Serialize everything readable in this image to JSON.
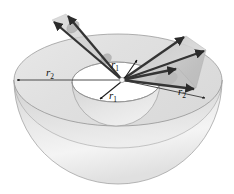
{
  "figure": {
    "labels": [
      {
        "id": "r2-left",
        "base": "r",
        "sub": "2",
        "x": 50,
        "y": 76,
        "name": "radius-label-r2-left"
      },
      {
        "id": "r1-upper",
        "base": "r",
        "sub": "1",
        "x": 115,
        "y": 68,
        "name": "radius-label-r1-upper"
      },
      {
        "id": "r1-lower",
        "base": "r",
        "sub": "1",
        "x": 113,
        "y": 99,
        "name": "radius-label-r1-lower"
      },
      {
        "id": "r2-right",
        "base": "r",
        "sub": "2",
        "x": 182,
        "y": 95,
        "name": "radius-label-r2-right"
      }
    ],
    "colors": {
      "outline": "#8a8a8a",
      "arrow": "#3a3a3a",
      "arrow_dark": "#262626",
      "top_annulus": "#e3e3e3",
      "inner_disk": "#efefef",
      "inner_bowl": "#dcdcdc",
      "outer_bowl_light": "#f2f2f2",
      "outer_bowl_mid": "#d9d9d9",
      "cone_fill": "#c9c9c9",
      "cone_fill_light": "#dedede",
      "background": "#ffffff",
      "label_text": "#111111"
    },
    "geometry": {
      "center": {
        "x": 122,
        "y": 80
      },
      "outer_ellipse": {
        "cx": 118,
        "cy": 80,
        "rx": 104,
        "ry": 46
      },
      "inner_ellipse": {
        "cx": 116,
        "cy": 82,
        "rx": 44,
        "ry": 20
      },
      "outer_bowl_depth": 104,
      "inner_bowl_depth": 42,
      "r2_left_endpoint": {
        "x": 15,
        "y": 80
      },
      "r2_right_endpoint": {
        "x": 207,
        "y": 99
      }
    },
    "ray_bundles": [
      {
        "name": "upper-left-bundle",
        "direction": "up-left",
        "rays": [
          {
            "x2": 52,
            "y2": 20
          },
          {
            "x2": 66,
            "y2": 14
          }
        ],
        "cone_shading": true
      },
      {
        "name": "right-bundle",
        "direction": "up-right and right",
        "rays": [
          {
            "x2": 186,
            "y2": 36
          },
          {
            "x2": 206,
            "y2": 50
          },
          {
            "x2": 178,
            "y2": 68
          },
          {
            "x2": 196,
            "y2": 88
          }
        ],
        "cone_shading": true
      }
    ],
    "radius_arrows": [
      {
        "name": "r1-arrow-upper",
        "from": {
          "x": 122,
          "y": 80
        },
        "to": {
          "x": 137,
          "y": 60
        }
      },
      {
        "name": "r1-arrow-lower",
        "from": {
          "x": 122,
          "y": 80
        },
        "to": {
          "x": 100,
          "y": 98
        }
      },
      {
        "name": "r2-arrow-left",
        "from": {
          "x": 122,
          "y": 80
        },
        "to": {
          "x": 15,
          "y": 80
        }
      },
      {
        "name": "r2-arrow-right",
        "from": {
          "x": 122,
          "y": 80
        },
        "to": {
          "x": 207,
          "y": 99
        }
      }
    ]
  }
}
